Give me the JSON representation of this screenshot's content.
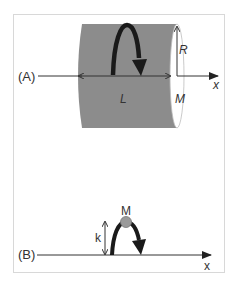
{
  "figure": {
    "panel_a": {
      "label": "(A)",
      "length_label": "L",
      "radius_label": "R",
      "mass_label": "M",
      "axis_label": "x",
      "colors": {
        "cylinder": "#8c8c8c",
        "arrow": "#1a1a1a",
        "axis": "#333333"
      }
    },
    "panel_b": {
      "label": "(B)",
      "mass_label": "M",
      "height_label": "k",
      "axis_label": "x",
      "colors": {
        "ball": "#9a9a9a",
        "arrow": "#1a1a1a",
        "axis": "#333333"
      }
    }
  }
}
